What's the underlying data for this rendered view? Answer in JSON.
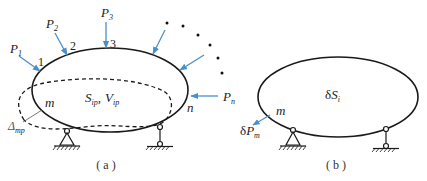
{
  "colors": {
    "outline": "#1a1a1a",
    "arrow": "#4a90c8",
    "text": "#222222",
    "background": "#ffffff"
  },
  "panel_a": {
    "caption": "( a )",
    "loads": [
      {
        "label": "P",
        "sub": "1",
        "point": "1"
      },
      {
        "label": "P",
        "sub": "2",
        "point": "2"
      },
      {
        "label": "P",
        "sub": "3",
        "point": "3"
      },
      {
        "label": "",
        "sub": "",
        "point": ""
      },
      {
        "label": "",
        "sub": "",
        "point": ""
      },
      {
        "label": "P",
        "sub": "n",
        "point": "n"
      }
    ],
    "point_labels": {
      "p1": "1",
      "p2": "2",
      "p3": "3",
      "pn": "n",
      "pm": "m"
    },
    "load_labels": {
      "P1": "P",
      "P1_sub": "1",
      "P2": "P",
      "P2_sub": "2",
      "P3": "P",
      "P3_sub": "3",
      "Pn": "P",
      "Pn_sub": "n"
    },
    "center_label": {
      "S": "S",
      "S_sub": "ip",
      "sep": ",",
      "V": "V",
      "V_sub": "ip"
    },
    "displacement_label": {
      "main": "Δ",
      "sub": "mp"
    }
  },
  "panel_b": {
    "caption": "( b )",
    "center_label": {
      "prefix": "δ",
      "S": "S",
      "S_sub": "i"
    },
    "point_label": "m",
    "virtual_load": {
      "prefix": "δ",
      "P": "P",
      "sub": "m"
    }
  }
}
